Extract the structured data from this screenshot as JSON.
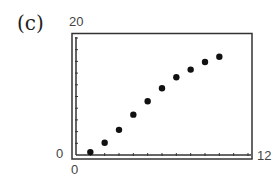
{
  "panel": {
    "label": "(c)"
  },
  "window": {
    "xmin_label": "0",
    "xmax_label": "12",
    "ymin_label": "0",
    "ymax_label": "20"
  },
  "chart_data": {
    "type": "scatter",
    "title": "",
    "panel_label": "(c)",
    "xlabel": "",
    "ylabel": "",
    "xlim": [
      0,
      12
    ],
    "ylim": [
      0,
      20
    ],
    "x_tick_step": 1,
    "y_tick_step": 2,
    "grid": false,
    "legend": null,
    "x": [
      1,
      2,
      3,
      4,
      5,
      6,
      7,
      8,
      9,
      10
    ],
    "y": [
      0.5,
      2.1,
      4.3,
      6.9,
      9.2,
      11.4,
      13.3,
      14.6,
      15.9,
      16.8
    ],
    "point_color": "#111111"
  }
}
